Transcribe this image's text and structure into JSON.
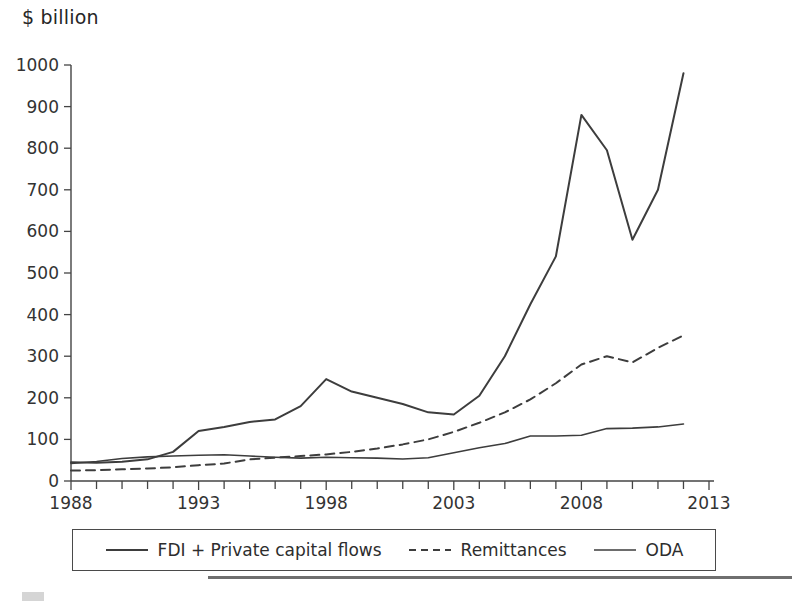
{
  "axis_title": "$ billion",
  "legend": {
    "entries": [
      {
        "label": "FDI + Private capital flows",
        "style": "solid",
        "icon": "solid-line-swatch"
      },
      {
        "label": "Remittances",
        "style": "dashed",
        "icon": "dashed-line-swatch"
      },
      {
        "label": "ODA",
        "style": "solid",
        "icon": "solid-line-swatch"
      }
    ]
  },
  "colors": {
    "line": "#3d3d3d",
    "axis": "#444444",
    "text": "#2d2d2d",
    "background": "#ffffff"
  },
  "chart_data": {
    "type": "line",
    "title": "",
    "subtitle": "",
    "xlabel": "",
    "ylabel": "$ billion",
    "xlim": [
      1988,
      2013
    ],
    "ylim": [
      0,
      1000
    ],
    "grid": false,
    "legend_position": "bottom",
    "x_tick_labels": [
      "1988",
      "1993",
      "1998",
      "2003",
      "2008",
      "2013"
    ],
    "x_tick_values": [
      1988,
      1993,
      1998,
      2003,
      2008,
      2013
    ],
    "x_minor_ticks_every": 1,
    "y_tick_labels": [
      "0",
      "100",
      "200",
      "300",
      "400",
      "500",
      "600",
      "700",
      "800",
      "900",
      "1000"
    ],
    "y_tick_values": [
      0,
      100,
      200,
      300,
      400,
      500,
      600,
      700,
      800,
      900,
      1000
    ],
    "x": [
      1988,
      1989,
      1990,
      1991,
      1992,
      1993,
      1994,
      1995,
      1996,
      1997,
      1998,
      1999,
      2000,
      2001,
      2002,
      2003,
      2004,
      2005,
      2006,
      2007,
      2008,
      2009,
      2010,
      2011
    ],
    "series": [
      {
        "name": "FDI + Private capital flows",
        "style": "solid",
        "width": 2.0,
        "values": [
          45,
          44,
          46,
          52,
          70,
          120,
          130,
          142,
          148,
          180,
          245,
          215,
          200,
          185,
          165,
          160,
          205,
          300,
          425,
          540,
          880,
          795,
          580,
          700
        ]
      },
      {
        "name": "Remittances",
        "style": "dashed",
        "width": 2.0,
        "values": [
          25,
          26,
          28,
          30,
          33,
          38,
          42,
          52,
          56,
          60,
          64,
          70,
          78,
          88,
          100,
          118,
          140,
          165,
          196,
          235,
          280,
          300,
          285,
          320
        ]
      },
      {
        "name": "ODA",
        "style": "solid",
        "width": 1.6,
        "values": [
          42,
          47,
          54,
          58,
          60,
          62,
          63,
          60,
          57,
          55,
          57,
          56,
          55,
          53,
          56,
          68,
          80,
          90,
          108,
          108,
          110,
          126,
          127,
          130
        ]
      }
    ],
    "series_extra_tail": {
      "note": "FDI rises to 980 and Remittances to 350, ODA to 137 at final point 2012",
      "x_last": 2012,
      "values_last": {
        "FDI + Private capital flows": 980,
        "Remittances": 350,
        "ODA": 137
      }
    }
  }
}
